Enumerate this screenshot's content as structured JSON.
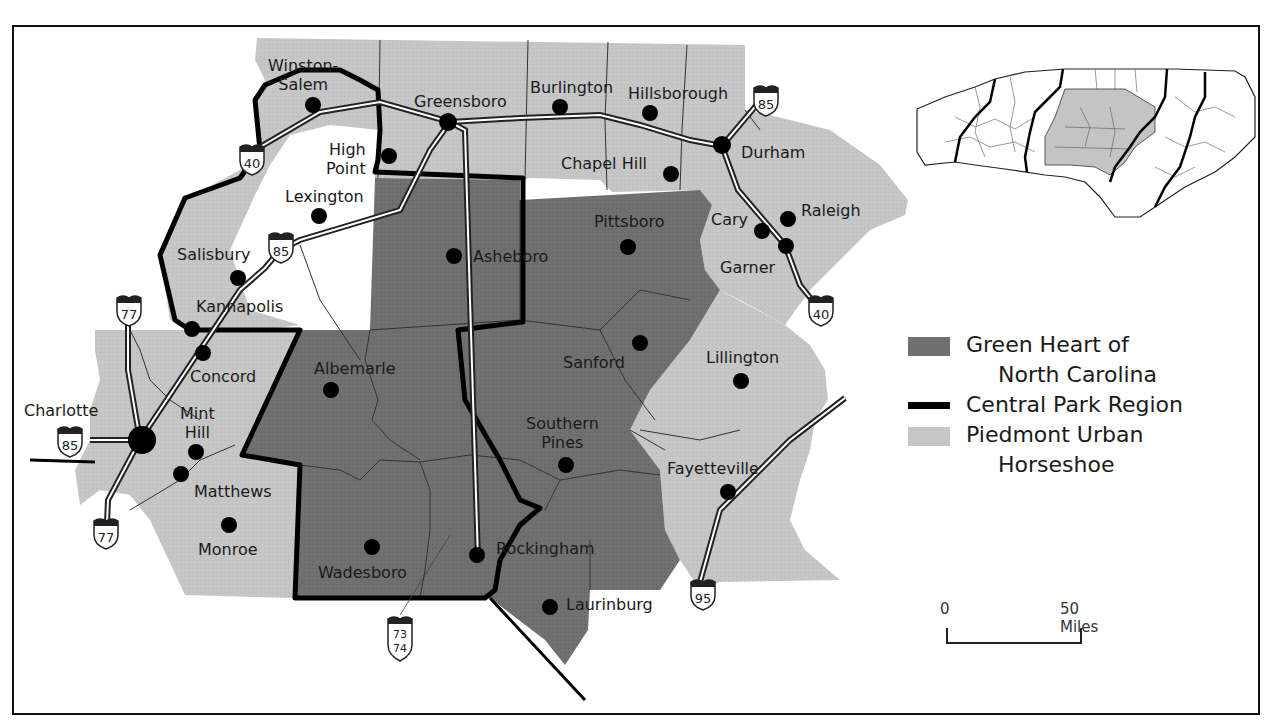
{
  "map": {
    "colors": {
      "green_heart": "#6e6e6e",
      "piedmont_horseshoe": "#c4c4c4",
      "central_park_border": "#000000",
      "background": "#ffffff",
      "county_line": "#333333",
      "highway_fill": "#ffffff"
    },
    "cities": [
      {
        "name": "Winston-Salem",
        "label_line1": "Winston-",
        "label_line2": "Salem"
      },
      {
        "name": "Greensboro",
        "label": "Greensboro"
      },
      {
        "name": "Burlington",
        "label": "Burlington"
      },
      {
        "name": "Hillsborough",
        "label": "Hillsborough"
      },
      {
        "name": "Durham",
        "label": "Durham"
      },
      {
        "name": "Chapel Hill",
        "label": "Chapel Hill"
      },
      {
        "name": "High Point",
        "label_line1": "High",
        "label_line2": "Point"
      },
      {
        "name": "Lexington",
        "label": "Lexington"
      },
      {
        "name": "Salisbury",
        "label": "Salisbury"
      },
      {
        "name": "Asheboro",
        "label": "Asheboro"
      },
      {
        "name": "Pittsboro",
        "label": "Pittsboro"
      },
      {
        "name": "Cary",
        "label": "Cary"
      },
      {
        "name": "Raleigh",
        "label": "Raleigh"
      },
      {
        "name": "Garner",
        "label": "Garner"
      },
      {
        "name": "Kannapolis",
        "label": "Kannapolis"
      },
      {
        "name": "Concord",
        "label": "Concord"
      },
      {
        "name": "Charlotte",
        "label": "Charlotte"
      },
      {
        "name": "Mint Hill",
        "label_line1": "Mint",
        "label_line2": "Hill"
      },
      {
        "name": "Matthews",
        "label": "Matthews"
      },
      {
        "name": "Monroe",
        "label": "Monroe"
      },
      {
        "name": "Albemarle",
        "label": "Albemarle"
      },
      {
        "name": "Sanford",
        "label": "Sanford"
      },
      {
        "name": "Lillington",
        "label": "Lillington"
      },
      {
        "name": "Southern Pines",
        "label_line1": "Southern",
        "label_line2": "Pines"
      },
      {
        "name": "Fayetteville",
        "label": "Fayetteville"
      },
      {
        "name": "Wadesboro",
        "label": "Wadesboro"
      },
      {
        "name": "Rockingham",
        "label": "Rockingham"
      },
      {
        "name": "Laurinburg",
        "label": "Laurinburg"
      }
    ],
    "highways": [
      {
        "id": "i40-west",
        "number": "40"
      },
      {
        "id": "i85-north",
        "number": "85"
      },
      {
        "id": "i85-salisbury",
        "number": "85"
      },
      {
        "id": "i40-east",
        "number": "40"
      },
      {
        "id": "i77-north",
        "number": "77"
      },
      {
        "id": "i85-charlotte",
        "number": "85"
      },
      {
        "id": "i77-south",
        "number": "77"
      },
      {
        "id": "i73-74",
        "number_line1": "73",
        "number_line2": "74"
      },
      {
        "id": "i95",
        "number": "95"
      }
    ]
  },
  "legend": {
    "items": [
      {
        "label_line1": "Green Heart of",
        "label_line2": "North Carolina",
        "symbol": "dark-gray-fill"
      },
      {
        "label": "Central Park Region",
        "symbol": "thick-black-line"
      },
      {
        "label_line1": "Piedmont Urban",
        "label_line2": "Horseshoe",
        "symbol": "light-gray-fill"
      }
    ]
  },
  "scale_bar": {
    "start_label": "0",
    "end_label": "50 Miles"
  },
  "inset": {
    "description": "North Carolina state outline with counties; highlighted central region"
  }
}
